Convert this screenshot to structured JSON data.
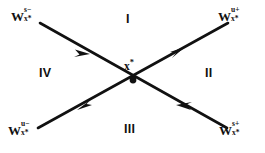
{
  "figure": {
    "type": "saddle-point-phase-portrait",
    "background_color": "#ffffff",
    "line_color": "#111111",
    "width": 265,
    "height": 153
  },
  "fixed_point": {
    "symbol": "x",
    "star": "*",
    "marker": "filled-dot",
    "x": 133,
    "y": 80
  },
  "manifolds": [
    {
      "id": "stable-incoming-upper-left",
      "base": "W",
      "superscript": "s−",
      "subscript": "x",
      "subscript_star": "*",
      "corner": "top-left",
      "arrow_direction": "toward-fixed-point",
      "flow": "stable"
    },
    {
      "id": "unstable-outgoing-upper-right",
      "base": "W",
      "superscript": "u+",
      "subscript": "x",
      "subscript_star": "*",
      "corner": "top-right",
      "arrow_direction": "away-from-fixed-point",
      "flow": "unstable"
    },
    {
      "id": "unstable-outgoing-lower-left",
      "base": "W",
      "superscript": "u−",
      "subscript": "x",
      "subscript_star": "*",
      "corner": "bottom-left",
      "arrow_direction": "away-from-fixed-point",
      "flow": "unstable"
    },
    {
      "id": "stable-incoming-lower-right",
      "base": "W",
      "superscript": "s+",
      "subscript": "x",
      "subscript_star": "*",
      "corner": "bottom-right",
      "arrow_direction": "toward-fixed-point",
      "flow": "stable"
    }
  ],
  "quadrants": [
    {
      "id": "i",
      "label": "I",
      "position": "top"
    },
    {
      "id": "ii",
      "label": "II",
      "position": "right"
    },
    {
      "id": "iii",
      "label": "III",
      "position": "bottom"
    },
    {
      "id": "iv",
      "label": "IV",
      "position": "left"
    }
  ]
}
